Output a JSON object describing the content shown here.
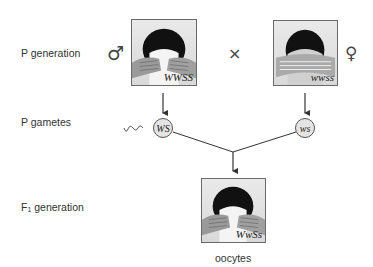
{
  "rows": {
    "p_generation": "P generation",
    "p_gametes": "P gametes",
    "f1_generation_prefix": "F",
    "f1_generation_sub": "1",
    "f1_generation_suffix": " generation"
  },
  "symbols": {
    "male": "♂",
    "female": "♀",
    "cross": "×"
  },
  "parents": {
    "male_genotype": "WWSS",
    "female_genotype": "wwss"
  },
  "gametes": {
    "male": "WS",
    "female": "ws"
  },
  "offspring": {
    "genotype": "WwSs",
    "caption": "oocytes"
  },
  "colors": {
    "line": "#333333",
    "photo_border": "#6a6a6a",
    "gamete_fill": "#e4e4e4",
    "hair": "#111111"
  }
}
